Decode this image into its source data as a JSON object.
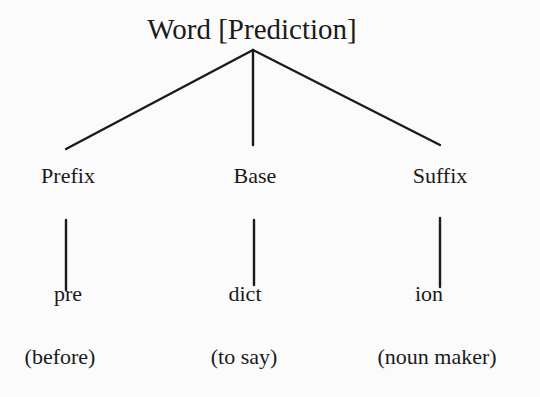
{
  "diagram": {
    "root": "Word [Prediction]",
    "branches": [
      {
        "category": "Prefix",
        "morpheme": "pre",
        "meaning": "(before)"
      },
      {
        "category": "Base",
        "morpheme": "dict",
        "meaning": "(to say)"
      },
      {
        "category": "Suffix",
        "morpheme": "ion",
        "meaning": "(noun maker)"
      }
    ]
  }
}
